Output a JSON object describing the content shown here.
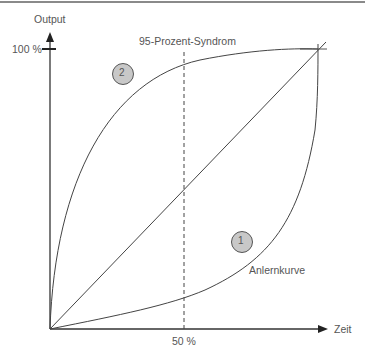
{
  "diagram": {
    "y_axis_label": "Output",
    "x_axis_label": "Zeit",
    "y_tick_label": "100 %",
    "x_tick_label": "50 %",
    "dashed_line_label": "95-Prozent-Syndrom",
    "curve_labels": {
      "curve1_badge": "1",
      "curve1_name": "Anlernkurve",
      "curve2_badge": "2"
    },
    "colors": {
      "line": "#444444",
      "badge_fill": "#c8c8c8",
      "text": "#555555"
    }
  }
}
